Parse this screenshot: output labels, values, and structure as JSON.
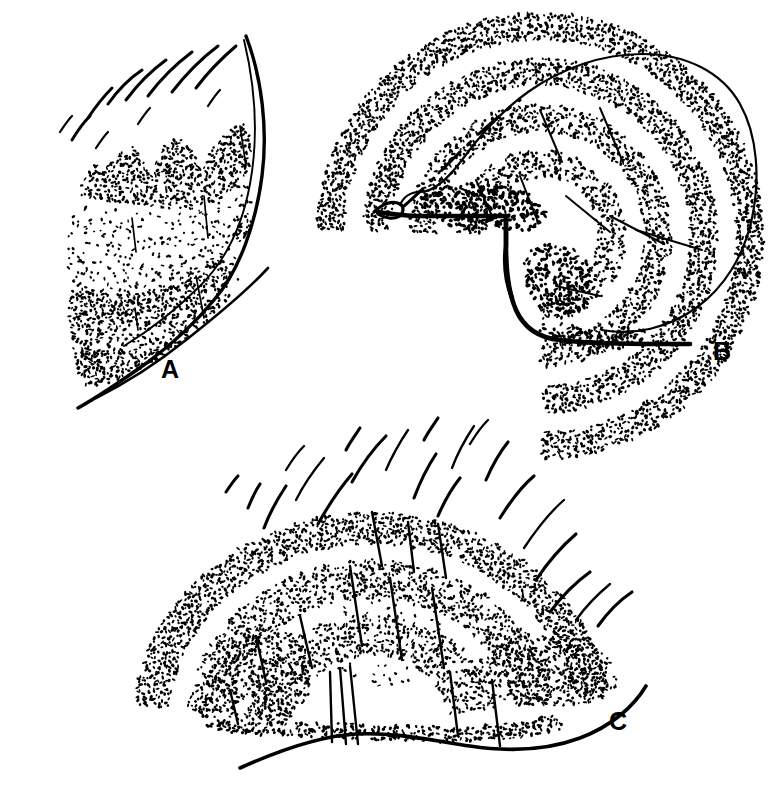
{
  "figure": {
    "background_color": "#ffffff",
    "ink_color": "#000000",
    "width": 780,
    "height": 798,
    "style": "stippled pen-and-ink scientific line drawing",
    "panel_count": 3
  },
  "panels": [
    {
      "id": "A",
      "label": "A",
      "label_x": 170,
      "label_y": 378,
      "description": "Lateral view of a stippled lobe with three rounded dorsal humps, a curved right margin and a radiating fan of curved setae above",
      "bristle_count": 11,
      "stipple_bands": 3
    },
    {
      "id": "B",
      "label": "B",
      "label_x": 722,
      "label_y": 360,
      "description": "Rounded stippled lobe with four concentric arched stipple bands, a stepped notch on the lower left margin and a heavy basal outline",
      "bristle_count": 0,
      "stipple_bands": 4
    },
    {
      "id": "C",
      "label": "C",
      "label_x": 618,
      "label_y": 730,
      "description": "Dome shaped stippled lobe seated on a sinuous basal line with a fan of long curved setae radiating upward and outward and several straight internal shafts",
      "bristle_count": 21,
      "stipple_bands": 4
    }
  ],
  "chart_data": {
    "type": "scatter",
    "title": "",
    "xlabel": "",
    "ylabel": "",
    "series": [
      {
        "name": "Panel A stipple",
        "count": 1450
      },
      {
        "name": "Panel B stipple",
        "count": 2100
      },
      {
        "name": "Panel C stipple",
        "count": 2050
      }
    ]
  },
  "geometry": {
    "A": {
      "body_outline": "M 78,270 L 62,236 L 72,186 L 100,160 L 128,146 L 150,128 L 165,148 L 188,124 L 205,146 L 224,120 L 240,95 L 252,80",
      "right_margin": "M 246,36 C 262,78 268,130 262,176 C 256,222 240,270 214,300 C 196,322 172,344 148,362 C 120,382 96,398 78,408",
      "inner_margin": "M 244,40 C 256,90 258,140 250,184 C 242,228 224,262 200,286 C 176,310 150,330 124,346",
      "base_line": "M 268,268 C 246,292 214,318 186,340 C 156,364 124,384 96,398",
      "humps": "M 96,168 C 106,150 120,140 132,150 C 140,158 144,170 148,178 C 152,160 162,142 176,140 C 190,138 196,152 200,168 C 206,152 216,138 228,134",
      "bristles": [
        "M 72,140 C 78,130 84,122 90,116",
        "M 88,118 C 96,106 104,96 112,88",
        "M 108,104 C 118,90 130,78 142,70",
        "M 126,100 C 138,84 152,70 166,60",
        "M 148,96 C 160,80 176,64 192,52",
        "M 172,92 C 186,74 202,58 218,46",
        "M 196,88 C 208,72 222,58 236,46",
        "M 60,132 C 64,126 68,120 72,116",
        "M 96,148 C 100,142 104,136 108,132",
        "M 138,124 C 142,118 146,112 150,108",
        "M 208,106 C 212,100 216,94 220,90"
      ],
      "internal_shafts": [
        "M 132,218 L 136,252",
        "M 204,196 L 208,238",
        "M 240,126 L 246,166",
        "M 196,276 L 204,318",
        "M 135,308 L 138,330"
      ],
      "stipple_bands": [
        {
          "name": "upper-dense",
          "seed": 11
        },
        {
          "name": "middle-sparse",
          "seed": 23
        },
        {
          "name": "lower-dense",
          "seed": 37
        }
      ]
    },
    "B": {
      "body_outline": "M 400,205 C 404,196 412,192 420,192 C 434,192 450,176 462,160 C 478,138 500,112 528,92 C 562,68 602,54 642,54 C 686,54 722,72 740,104 C 758,136 760,180 752,218 C 744,256 724,288 696,308 C 668,328 634,336 602,330",
      "basal_line": "M 378,212 C 392,214 406,216 420,216 C 450,216 482,216 506,216 L 506,246 C 506,268 508,292 516,310 C 524,328 540,338 560,340 C 592,344 640,344 690,344",
      "notch": "M 506,216 L 506,246 C 504,262 506,282 512,298",
      "left_tip": "M 374,212 C 382,204 392,200 400,204 C 404,206 404,212 400,216 C 394,220 384,218 378,214",
      "arch_bands": [
        {
          "name": "band-1-outer",
          "seed": 41
        },
        {
          "name": "band-2",
          "seed": 53
        },
        {
          "name": "band-3",
          "seed": 67
        },
        {
          "name": "band-4-inner",
          "seed": 79
        }
      ],
      "internal_shafts": [
        "M 540,110 L 562,162",
        "M 600,108 L 622,160",
        "M 476,180 L 492,216",
        "M 520,176 L 538,222",
        "M 566,196 L 610,232",
        "M 610,216 L 664,244",
        "M 556,286 L 600,296",
        "M 636,230 L 702,250",
        "M 460,188 L 478,196"
      ]
    },
    "C": {
      "base_line": "M 240,768 C 280,750 320,736 356,734 C 394,732 430,740 470,746 C 510,752 548,750 580,738 C 612,726 634,706 646,686",
      "body_outline": "M 196,716 C 204,680 220,636 248,600 C 276,564 314,534 354,518 C 394,502 436,502 470,518 C 504,534 528,564 540,598 C 548,622 552,646 552,664",
      "right_lobe": "M 470,656 C 496,636 528,624 556,624 C 584,624 606,636 620,654 C 630,668 634,682 634,692",
      "bristles": [
        "M 248,508 C 252,498 256,490 260,484",
        "M 264,528 C 270,512 278,498 286,486",
        "M 296,500 C 304,484 314,470 324,458",
        "M 318,524 C 328,506 340,488 352,474",
        "M 352,482 C 362,464 374,448 386,436",
        "M 386,470 C 392,456 400,442 408,430",
        "M 414,498 C 420,482 428,466 436,454",
        "M 438,516 C 444,502 452,488 460,478",
        "M 452,468 C 458,452 466,438 474,426",
        "M 486,480 C 492,466 500,452 508,442",
        "M 500,518 C 510,502 522,486 534,476",
        "M 524,548 C 536,530 550,512 564,500",
        "M 536,580 C 548,562 562,546 576,534",
        "M 550,612 C 562,596 576,582 590,572",
        "M 576,620 C 586,606 598,594 610,584",
        "M 598,626 C 608,612 620,600 632,592",
        "M 226,492 C 230,486 234,480 238,476",
        "M 286,470 C 292,460 298,452 304,446",
        "M 346,450 C 350,442 356,434 360,428",
        "M 424,440 C 428,432 434,424 438,418",
        "M 470,444 C 476,434 482,426 488,420"
      ],
      "internal_shafts": [
        "M 372,512 L 382,566",
        "M 408,522 L 414,572",
        "M 438,524 L 446,578",
        "M 350,566 L 362,646",
        "M 390,578 L 402,660",
        "M 432,588 L 444,668",
        "M 300,616 L 312,668",
        "M 256,636 L 266,682",
        "M 330,672 L 332,742",
        "M 340,668 L 346,744",
        "M 350,666 L 358,744",
        "M 450,672 L 458,736",
        "M 492,680 L 500,746",
        "M 230,690 L 238,724"
      ],
      "stipple_bands": [
        {
          "name": "dome-upper",
          "seed": 83
        },
        {
          "name": "dome-mid",
          "seed": 97
        },
        {
          "name": "dome-lower",
          "seed": 101
        },
        {
          "name": "right-lobe",
          "seed": 113
        }
      ]
    }
  }
}
